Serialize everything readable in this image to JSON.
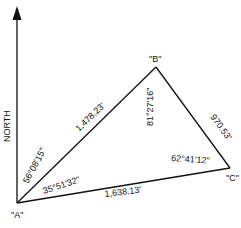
{
  "diagram": {
    "type": "survey-traverse",
    "north_label": "NORTH",
    "points": [
      {
        "id": "A",
        "label": "\"A\"",
        "x": 17,
        "y": 203
      },
      {
        "id": "B",
        "label": "\"B\"",
        "x": 156,
        "y": 67
      },
      {
        "id": "C",
        "label": "\"C\"",
        "x": 230,
        "y": 168
      }
    ],
    "sides": [
      {
        "from": "A",
        "to": "B",
        "length": "1,478.23'"
      },
      {
        "from": "B",
        "to": "C",
        "length": "970.53'"
      },
      {
        "from": "A",
        "to": "C",
        "length": "1,638.13'"
      }
    ],
    "angles": [
      {
        "at": "A",
        "label": "35°51'32\"",
        "description": "interior angle at A"
      },
      {
        "at": "A",
        "label": "56°08'15\"",
        "description": "bearing angle from north to AB"
      },
      {
        "at": "B",
        "label": "81°27'16\""
      },
      {
        "at": "C",
        "label": "62°41'12\""
      }
    ]
  }
}
